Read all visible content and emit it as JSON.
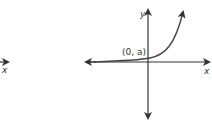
{
  "diagram": {
    "type": "exponential-growth-graph",
    "left_fragment": {
      "axis_label": "x"
    },
    "main_graph": {
      "x_axis_label": "x",
      "y_axis_label": "y",
      "point_label": "(0, a)",
      "curve": "exponential growth",
      "colors": {
        "axis": "#333333",
        "curve": "#444444"
      }
    }
  }
}
